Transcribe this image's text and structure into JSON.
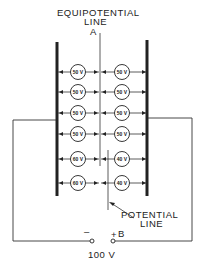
{
  "diagram": {
    "labels": {
      "equipotential_line_1": "EQUIPOTENTIAL",
      "equipotential_line_2": "LINE",
      "equipotential_point": "A",
      "potential_line_1": "POTENTIAL",
      "potential_line_2": "LINE",
      "negative_terminal": "–",
      "positive_terminal": "+",
      "point_b": "B",
      "source_voltage": "100 V"
    },
    "cells": {
      "rows": [
        {
          "left": "50 V",
          "right": "50 V"
        },
        {
          "left": "50 V",
          "right": "50 V"
        },
        {
          "left": "50 V",
          "right": "50 V"
        },
        {
          "left": "50 V",
          "right": "50 V"
        },
        {
          "left": "60 V",
          "right": "40 V"
        },
        {
          "left": "60 V",
          "right": "40 V"
        }
      ]
    },
    "colors": {
      "ink": "#222222",
      "background": "#ffffff"
    }
  }
}
